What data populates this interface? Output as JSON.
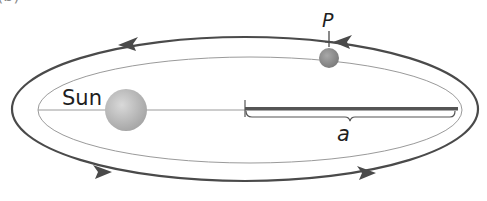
{
  "figure": {
    "labels": {
      "sun": "Sun",
      "planet": "P",
      "semi_major_axis": "a",
      "clipped_panel_mark": "(b)"
    },
    "colors": {
      "orbit_path": "#4a4a4a",
      "inner_ellipse": "#9a9a9a",
      "sun": "#b8b8b8",
      "planet": "#8a8a8a",
      "semi_major_bar": "#555555",
      "text": "#1e1e1e"
    },
    "arrows": {
      "direction": "counterclockwise",
      "count": 4
    }
  }
}
